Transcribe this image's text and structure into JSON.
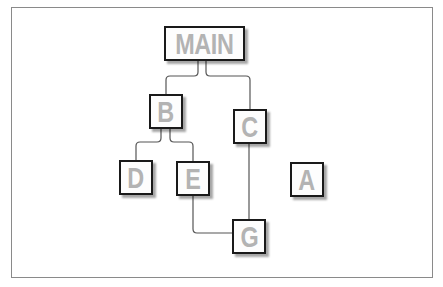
{
  "diagram": {
    "type": "tree",
    "nodes": [
      {
        "id": "MAIN",
        "label": "MAIN"
      },
      {
        "id": "B",
        "label": "B"
      },
      {
        "id": "C",
        "label": "C"
      },
      {
        "id": "D",
        "label": "D"
      },
      {
        "id": "E",
        "label": "E"
      },
      {
        "id": "A",
        "label": "A"
      },
      {
        "id": "G",
        "label": "G"
      }
    ],
    "edges": [
      {
        "from": "MAIN",
        "to": "B"
      },
      {
        "from": "MAIN",
        "to": "C"
      },
      {
        "from": "B",
        "to": "D"
      },
      {
        "from": "B",
        "to": "E"
      },
      {
        "from": "C",
        "to": "G"
      },
      {
        "from": "E",
        "to": "G"
      }
    ],
    "colors": {
      "node_border": "#1a1a1a",
      "node_text": "#b3b3b3",
      "edge": "#555555",
      "frame": "#8a8a8a"
    }
  }
}
